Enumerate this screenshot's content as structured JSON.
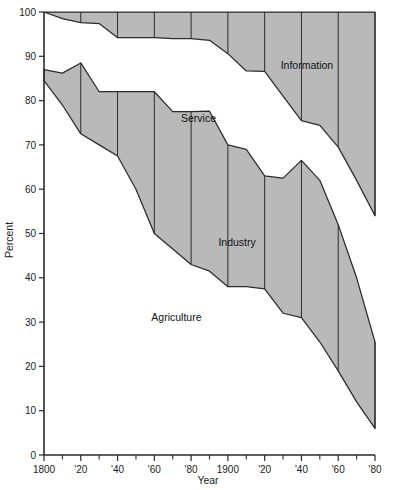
{
  "chart_data": {
    "type": "area",
    "title": "",
    "subtitle": "",
    "xlabel": "Year",
    "ylabel": "Percent",
    "xlim": [
      1800,
      1980
    ],
    "ylim": [
      0,
      100
    ],
    "grid": true,
    "legend_position": "inline-labels",
    "x_tick_labels": [
      "1800",
      "'20",
      "'40",
      "'60",
      "'80",
      "1900",
      "'20",
      "'40",
      "'60",
      "'80"
    ],
    "x_tick_values": [
      1800,
      1820,
      1840,
      1860,
      1880,
      1900,
      1920,
      1940,
      1960,
      1980
    ],
    "x_minor_tick_values": [
      1810,
      1830,
      1850,
      1870,
      1890,
      1910,
      1930,
      1950,
      1970
    ],
    "y_tick_labels": [
      "0",
      "10",
      "20",
      "30",
      "40",
      "50",
      "60",
      "70",
      "80",
      "90",
      "100"
    ],
    "y_tick_values": [
      0,
      10,
      20,
      30,
      40,
      50,
      60,
      70,
      80,
      90,
      100
    ],
    "annotations": [
      {
        "text": "Information",
        "x": 1943,
        "y": 88
      },
      {
        "text": "Service",
        "x": 1884,
        "y": 76
      },
      {
        "text": "Industry",
        "x": 1905,
        "y": 48
      },
      {
        "text": "Agriculture",
        "x": 1872,
        "y": 31
      }
    ],
    "series": [
      {
        "name": "Information",
        "kind": "band",
        "x": [
          1800,
          1810,
          1820,
          1830,
          1840,
          1850,
          1860,
          1870,
          1880,
          1890,
          1900,
          1910,
          1920,
          1930,
          1940,
          1950,
          1960,
          1970,
          1980
        ],
        "upper": [
          100,
          100,
          100,
          100,
          100,
          100,
          100,
          100,
          100,
          100,
          100,
          100,
          100,
          100,
          100,
          100,
          100,
          100,
          100
        ],
        "lower": [
          100,
          98.5,
          97.6,
          97.4,
          94.2,
          94.2,
          94.2,
          94.0,
          94.0,
          93.6,
          90.6,
          86.7,
          86.6,
          81.0,
          75.5,
          74.4,
          69.5,
          62.0,
          54.0
        ]
      },
      {
        "name": "Industry",
        "kind": "band",
        "x": [
          1800,
          1810,
          1820,
          1830,
          1840,
          1850,
          1860,
          1870,
          1880,
          1890,
          1900,
          1910,
          1920,
          1930,
          1940,
          1950,
          1960,
          1970,
          1980
        ],
        "upper": [
          87.0,
          86.2,
          88.5,
          82.0,
          82.0,
          82.0,
          82.0,
          77.5,
          77.5,
          77.6,
          70.0,
          69.0,
          63.0,
          62.5,
          66.5,
          62.0,
          52.0,
          40.0,
          25.5
        ],
        "lower": [
          84.5,
          79.0,
          72.5,
          70.0,
          67.5,
          60.0,
          50.0,
          46.5,
          43.0,
          41.5,
          38.0,
          38.0,
          37.5,
          32.0,
          31.0,
          25.5,
          19.0,
          12.0,
          6.0
        ]
      }
    ],
    "band_fill_color": "#b9b9b9",
    "band_line_color": "#2b2b2b",
    "background_color": "#ffffff"
  },
  "axis": {
    "x_title": "Year",
    "y_title": "Percent"
  }
}
